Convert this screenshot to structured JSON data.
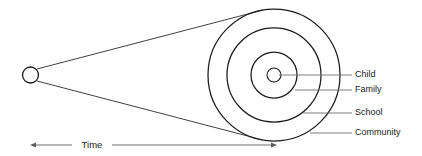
{
  "diagram": {
    "type": "concentric-cone",
    "stroke_color": "#1a1a1a",
    "leader_color": "#6f6f6f",
    "background_color": "#ffffff",
    "origin": {
      "name": "origin-point",
      "cx": 30.5,
      "cy": 75,
      "r": 8
    },
    "rings": [
      {
        "key": "child",
        "label": "Child",
        "radius": 7,
        "leader_y": 75,
        "leader_x_start": 279,
        "leader_x_end": 352,
        "label_x": 355,
        "label_y": 75
      },
      {
        "key": "family",
        "label": "Family",
        "radius": 23,
        "leader_y": 90,
        "leader_x_start": 295,
        "leader_x_end": 352,
        "label_x": 355,
        "label_y": 90
      },
      {
        "key": "school",
        "label": "School",
        "radius": 47,
        "leader_y": 113,
        "leader_x_start": 303,
        "leader_x_end": 352,
        "label_x": 355,
        "label_y": 113
      },
      {
        "key": "community",
        "label": "Community",
        "radius": 66,
        "leader_y": 133,
        "leader_x_start": 310,
        "leader_x_end": 352,
        "label_x": 355,
        "label_y": 133
      }
    ],
    "ring_center": {
      "cx": 274,
      "cy": 75
    },
    "cone": {
      "top_start_x": 37,
      "top_start_y": 69,
      "top_end_x": 263,
      "top_end_y": 10,
      "bottom_start_x": 37,
      "bottom_start_y": 81,
      "bottom_end_x": 263,
      "bottom_end_y": 140
    },
    "time_axis": {
      "label": "Time",
      "y": 145,
      "x_start": 30,
      "x_end": 277,
      "label_x": 92,
      "label_gap_left": 72,
      "label_gap_right": 112
    }
  }
}
